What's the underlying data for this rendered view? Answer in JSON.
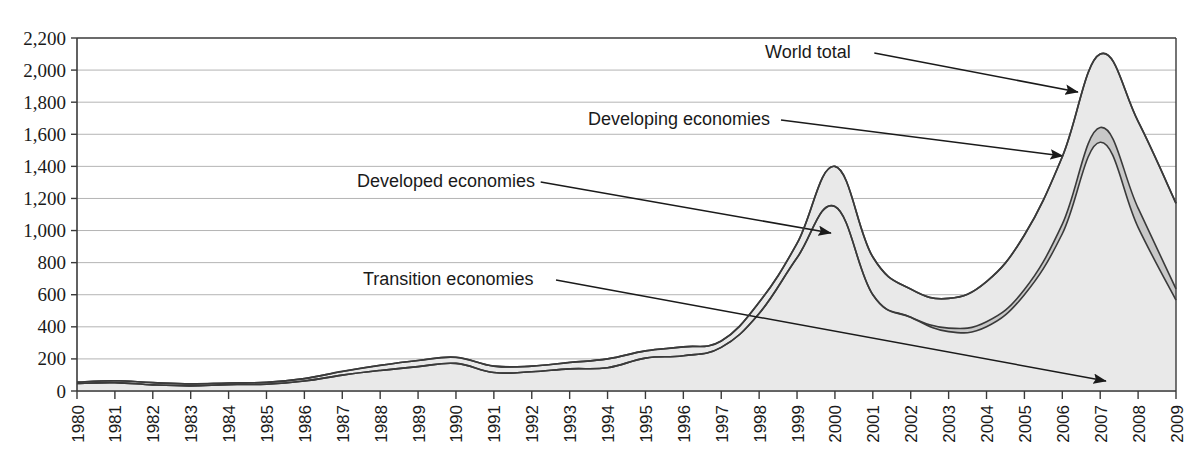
{
  "chart_data": {
    "type": "area",
    "stacked": true,
    "title": "",
    "subtitle": "",
    "xlabel": "",
    "ylabel": "",
    "xlim": [
      1980,
      2009
    ],
    "ylim": [
      0,
      2200
    ],
    "ytick_step": 200,
    "grid": true,
    "legend_position": "inline-annotations",
    "x": [
      1980,
      1981,
      1982,
      1983,
      1984,
      1985,
      1986,
      1987,
      1988,
      1989,
      1990,
      1991,
      1992,
      1993,
      1994,
      1995,
      1996,
      1997,
      1998,
      1999,
      2000,
      2001,
      2002,
      2003,
      2004,
      2005,
      2006,
      2007,
      2008,
      2009
    ],
    "xticklabels": [
      "1980",
      "1981",
      "1982",
      "1983",
      "1984",
      "1985",
      "1986",
      "1987",
      "1988",
      "1989",
      "1990",
      "1991",
      "1992",
      "1993",
      "1994",
      "1995",
      "1996",
      "1997",
      "1998",
      "1999",
      "2000",
      "2001",
      "2002",
      "2003",
      "2004",
      "2005",
      "2006",
      "2007",
      "2008",
      "2009"
    ],
    "yticklabels": [
      "0",
      "200",
      "400",
      "600",
      "800",
      "1,000",
      "1,200",
      "1,400",
      "1,600",
      "1,800",
      "2,000",
      "2,200"
    ],
    "yticks": [
      0,
      200,
      400,
      600,
      800,
      1000,
      1200,
      1400,
      1600,
      1800,
      2000,
      2200
    ],
    "series": [
      {
        "name": "Developed economies",
        "fill_color": "#e9e9e9",
        "line_color": "#3a3a3a",
        "values": [
          47,
          52,
          38,
          32,
          40,
          42,
          62,
          99,
          128,
          152,
          172,
          115,
          120,
          138,
          145,
          205,
          220,
          272,
          483,
          830,
          1150,
          600,
          460,
          370,
          400,
          600,
          980,
          1550,
          1020,
          566
        ]
      },
      {
        "name": "Transition economies",
        "fill_color": "#c8c8c8",
        "line_color": "#3a3a3a",
        "values": [
          0,
          0,
          0,
          0,
          0,
          0,
          0,
          0,
          0,
          0,
          0,
          0,
          0,
          0,
          0,
          0,
          0,
          0,
          0,
          0,
          0,
          0,
          0,
          22,
          32,
          32,
          60,
          92,
          120,
          70
        ]
      },
      {
        "name": "Developing economies",
        "fill_color": "#e9e9e9",
        "line_color": "#3a3a3a",
        "values": [
          8,
          12,
          14,
          12,
          10,
          12,
          15,
          23,
          32,
          38,
          38,
          40,
          35,
          40,
          55,
          45,
          55,
          40,
          70,
          90,
          250,
          235,
          175,
          185,
          250,
          340,
          420,
          458,
          540,
          534
        ]
      }
    ],
    "world_total": {
      "name": "World total",
      "line_color": "#3a3a3a",
      "values": [
        55,
        64,
        52,
        44,
        50,
        54,
        77,
        122,
        160,
        190,
        210,
        155,
        155,
        178,
        200,
        250,
        275,
        312,
        553,
        920,
        1400,
        835,
        635,
        577,
        682,
        972,
        1460,
        2100,
        1680,
        1170
      ]
    },
    "annotations": [
      {
        "label": "World total",
        "x": 765,
        "y": 58,
        "leader_to_x": 1078,
        "leader_to_y": 92
      },
      {
        "label": "Developing economies",
        "x": 588,
        "y": 125,
        "leader_to_x": 1063,
        "leader_to_y": 156
      },
      {
        "label": "Developed economies",
        "x": 357,
        "y": 187,
        "leader_to_x": 831,
        "leader_to_y": 233
      },
      {
        "label": "Transition economies",
        "x": 363,
        "y": 285,
        "leader_to_x": 1106,
        "leader_to_y": 381
      }
    ]
  },
  "axes": {
    "frame_color": "#3a3a3a",
    "grid_color": "#b4b4b4",
    "tick_color": "#3a3a3a"
  }
}
